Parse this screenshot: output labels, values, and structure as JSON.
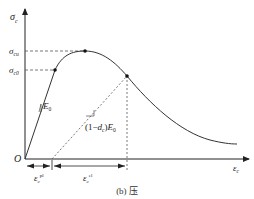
{
  "diagram": {
    "type": "stress-strain-curve",
    "caption": "(b) 压",
    "axes": {
      "y_label_symbol": "σ",
      "y_label_sub": "c",
      "x_label_symbol": "ε",
      "x_label_sub": "c",
      "origin_label": "O"
    },
    "stress_levels": [
      {
        "symbol": "σ",
        "sub": "cu",
        "description": "peak (ultimate) compressive stress"
      },
      {
        "symbol": "σ",
        "sub": "c0",
        "description": "initial yield compressive stress"
      }
    ],
    "slopes": {
      "initial": "E",
      "initial_sub": "0",
      "unloading_prefix": "(1−",
      "unloading_d": "d",
      "unloading_d_sub": "c",
      "unloading_suffix": ")",
      "unloading_E": "E",
      "unloading_E_sub": "0"
    },
    "strain_segments": [
      {
        "symbol": "ε",
        "sub": "c",
        "sup": "pl",
        "description": "plastic strain"
      },
      {
        "symbol": "ε",
        "sub": "c",
        "sup": "el",
        "description": "elastic strain"
      }
    ],
    "colors": {
      "line": "#333333",
      "dashed": "#555555",
      "background": "#ffffff"
    }
  }
}
